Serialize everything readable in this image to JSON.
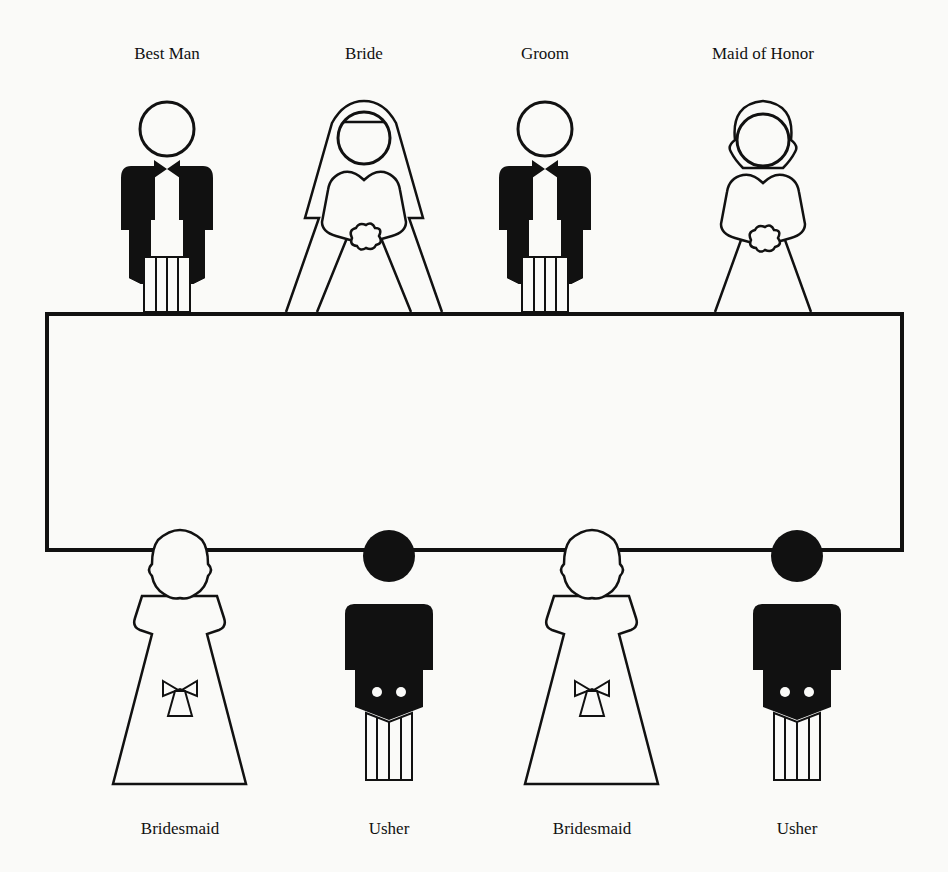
{
  "diagram": {
    "colors": {
      "ink": "#111111",
      "paper": "#fafaf8"
    },
    "table": {
      "shape": "rectangle",
      "x": 47,
      "y": 314,
      "width": 855,
      "height": 236
    },
    "top_row": [
      {
        "label": "Best Man",
        "figure": "tuxedo-man",
        "cx": 167
      },
      {
        "label": "Bride",
        "figure": "bride-with-veil",
        "cx": 364
      },
      {
        "label": "Groom",
        "figure": "tuxedo-man",
        "cx": 545
      },
      {
        "label": "Maid of Honor",
        "figure": "maid-of-honor",
        "cx": 763
      }
    ],
    "bottom_row": [
      {
        "label": "Bridesmaid",
        "figure": "bridesmaid",
        "cx": 180
      },
      {
        "label": "Usher",
        "figure": "usher",
        "cx": 389
      },
      {
        "label": "Bridesmaid",
        "figure": "bridesmaid",
        "cx": 592
      },
      {
        "label": "Usher",
        "figure": "usher",
        "cx": 797
      }
    ]
  }
}
